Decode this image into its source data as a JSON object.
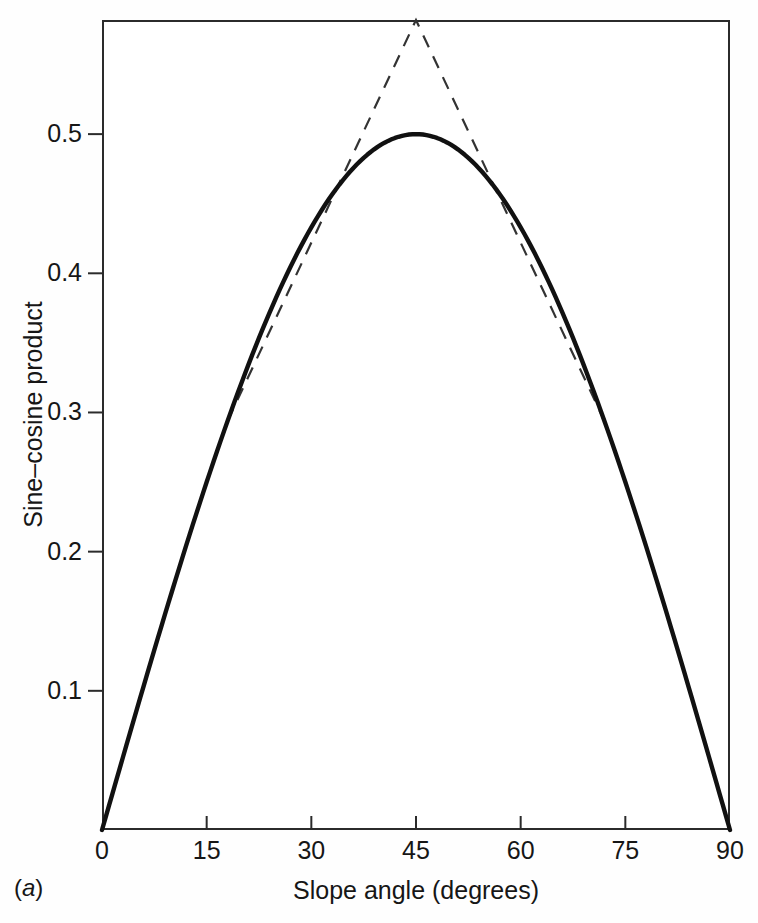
{
  "figure": {
    "panel_label_prefix": "(",
    "panel_label_letter": "a",
    "panel_label_suffix": ")",
    "panel_label_full": "(a)",
    "background_color": "#fefefe",
    "frame_color": "#2b2b2b",
    "curve_color": "#111111",
    "dashed_color": "#333333"
  },
  "chart_data": {
    "type": "line",
    "title": "",
    "subtitle": "",
    "xlabel": "Slope angle (degrees)",
    "ylabel": "Sine–cosine product",
    "xlim": [
      0,
      90
    ],
    "ylim": [
      0,
      0.582
    ],
    "grid": false,
    "legend": "none",
    "xticks": [
      0,
      15,
      30,
      45,
      60,
      75,
      90
    ],
    "xtick_labels": [
      "0",
      "15",
      "30",
      "45",
      "60",
      "75",
      "90"
    ],
    "yticks": [
      0.1,
      0.2,
      0.3,
      0.4,
      0.5
    ],
    "ytick_labels": [
      "0.1",
      "0.2",
      "0.3",
      "0.4",
      "0.5"
    ],
    "series": [
      {
        "name": "sine-cosine product",
        "style": "solid",
        "color": "#111111",
        "x": [
          0,
          5,
          10,
          15,
          18,
          20,
          25,
          30,
          35,
          40,
          45,
          50,
          55,
          60,
          65,
          70,
          72,
          75,
          80,
          85,
          90
        ],
        "values": [
          0.0,
          0.087,
          0.171,
          0.25,
          0.294,
          0.321,
          0.383,
          0.433,
          0.47,
          0.492,
          0.5,
          0.492,
          0.47,
          0.433,
          0.383,
          0.321,
          0.294,
          0.25,
          0.171,
          0.087,
          0.0
        ]
      },
      {
        "name": "linear extension (left limb)",
        "style": "dashed",
        "color": "#333333",
        "x": [
          18,
          45
        ],
        "values": [
          0.294,
          0.582
        ]
      },
      {
        "name": "linear extension (right limb)",
        "style": "dashed",
        "color": "#333333",
        "x": [
          45,
          72
        ],
        "values": [
          0.582,
          0.294
        ]
      }
    ],
    "annotations": [
      {
        "name": "peak-of-solid-curve",
        "x": 45,
        "y": 0.5,
        "text": ""
      },
      {
        "name": "apex-of-dashed-triangle",
        "x": 45,
        "y": 0.582,
        "text": ""
      }
    ]
  }
}
